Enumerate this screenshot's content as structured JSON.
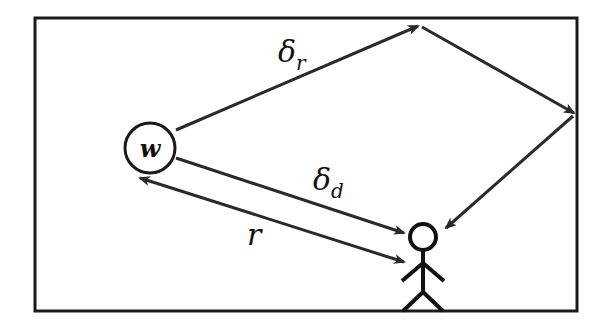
{
  "diagram": {
    "colors": {
      "stroke": "#2a2a2a",
      "background": "#ffffff"
    },
    "nodes": {
      "source": {
        "label": "w",
        "shape": "circle"
      },
      "listener": {
        "label": "",
        "shape": "stick-figure"
      }
    },
    "paths": {
      "reflected": {
        "label_main": "δ",
        "label_sub": "r",
        "description": "reflected path via top wall and right wall"
      },
      "direct": {
        "label_main": "δ",
        "label_sub": "d",
        "description": "direct path from source to listener"
      },
      "distance": {
        "label_main": "r",
        "label_sub": "",
        "description": "double-headed distance arrow"
      }
    }
  }
}
